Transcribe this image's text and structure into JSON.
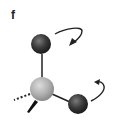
{
  "figure": {
    "panel_label": "f",
    "atoms": [
      {
        "id": "top-atom",
        "color": "#3a3a3a",
        "cx": 41,
        "cy": 44,
        "r": 10
      },
      {
        "id": "central-atom",
        "color": "#b0b0b0",
        "cx": 42,
        "cy": 89,
        "r": 12
      },
      {
        "id": "right-atom",
        "color": "#3a3a3a",
        "cx": 78,
        "cy": 104,
        "r": 10
      }
    ],
    "bonds": [
      {
        "type": "single",
        "from": "top-atom",
        "to": "central-atom"
      },
      {
        "type": "single",
        "from": "central-atom",
        "to": "right-atom"
      },
      {
        "type": "dashed",
        "from": "central-atom",
        "direction": "left-back"
      },
      {
        "type": "wedge",
        "from": "central-atom",
        "direction": "down-left-front"
      }
    ],
    "arrows": [
      {
        "id": "rotation-arrow-top",
        "description": "curved clockwise arrow near top atom"
      },
      {
        "id": "rotation-arrow-right",
        "description": "curved counter-clockwise arrow near right atom"
      }
    ]
  }
}
